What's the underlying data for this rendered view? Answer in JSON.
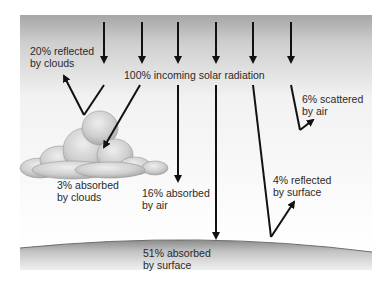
{
  "diagram": {
    "title": "100% incoming solar radiation",
    "colors": {
      "sky_top": "#a9a9a9",
      "sky_bottom": "#ffffff",
      "arrow": "#111111",
      "ground_edge": "#777777",
      "text": "#2a2a2a"
    },
    "labels": {
      "reflected_clouds": {
        "line1": "20% reflected",
        "line2": "by clouds"
      },
      "absorbed_clouds": {
        "line1": "3% absorbed",
        "line2": "by clouds"
      },
      "absorbed_air": {
        "line1": "16% absorbed",
        "line2": "by air"
      },
      "absorbed_surface": {
        "line1": "51% absorbed",
        "line2": "by surface"
      },
      "reflected_surface": {
        "line1": "4% reflected",
        "line2": "by surface"
      },
      "scattered_air": {
        "line1": "6% scattered",
        "line2": "by air"
      }
    },
    "nodes": [
      "incoming solar radiation",
      "clouds",
      "air",
      "surface"
    ],
    "edges": [
      {
        "from": "incoming solar radiation",
        "to": "space",
        "value": "20%",
        "type": "reflected by clouds"
      },
      {
        "from": "incoming solar radiation",
        "to": "clouds",
        "value": "3%",
        "type": "absorbed by clouds"
      },
      {
        "from": "incoming solar radiation",
        "to": "air",
        "value": "16%",
        "type": "absorbed by air"
      },
      {
        "from": "incoming solar radiation",
        "to": "surface",
        "value": "51%",
        "type": "absorbed by surface"
      },
      {
        "from": "incoming solar radiation",
        "to": "space",
        "value": "4%",
        "type": "reflected by surface"
      },
      {
        "from": "incoming solar radiation",
        "to": "space",
        "value": "6%",
        "type": "scattered by air"
      }
    ]
  }
}
